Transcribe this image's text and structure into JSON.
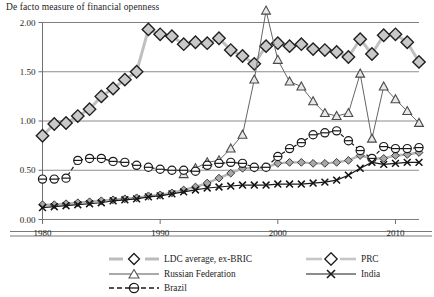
{
  "chart_data": {
    "type": "line",
    "title": "De facto measure of financial openness",
    "xlabel": "",
    "ylabel": "",
    "xlim": [
      1980,
      2012
    ],
    "ylim": [
      0.0,
      2.0
    ],
    "grid": "horizontal",
    "legend_position": "bottom",
    "y_ticks": [
      "0.00",
      "0.50",
      "1.00",
      "1.50",
      "2.00"
    ],
    "y_tick_values": [
      0.0,
      0.5,
      1.0,
      1.5,
      2.0
    ],
    "x_ticks": [
      "1980",
      "1990",
      "2000",
      "2010"
    ],
    "x_tick_values": [
      1980,
      1990,
      2000,
      2010
    ],
    "series": [
      {
        "name": "LDC average, ex-BRIC",
        "marker": "diamond-filled-gray",
        "color": "#8c8c8c",
        "line_color": "#b4b4b4",
        "x": [
          1980,
          1981,
          1982,
          1983,
          1984,
          1985,
          1986,
          1987,
          1988,
          1989,
          1990,
          1991,
          1992,
          1993,
          1994,
          1995,
          1996,
          1997,
          1998,
          1999,
          2000,
          2001,
          2002,
          2003,
          2004,
          2005,
          2006,
          2007,
          2008,
          2009,
          2010,
          2011,
          2012
        ],
        "values": [
          0.15,
          0.15,
          0.16,
          0.17,
          0.18,
          0.19,
          0.2,
          0.21,
          0.22,
          0.24,
          0.25,
          0.27,
          0.3,
          0.33,
          0.37,
          0.42,
          0.47,
          0.52,
          0.52,
          0.53,
          0.57,
          0.58,
          0.58,
          0.57,
          0.57,
          0.58,
          0.6,
          0.65,
          0.62,
          0.62,
          0.65,
          0.66,
          0.68
        ]
      },
      {
        "name": "PRC",
        "marker": "diamond-large-gray",
        "color": "#777777",
        "line_color": "#c0c0c0",
        "x": [
          1980,
          1981,
          1982,
          1983,
          1984,
          1985,
          1986,
          1987,
          1988,
          1989,
          1990,
          1991,
          1992,
          1993,
          1994,
          1995,
          1996,
          1997,
          1998,
          1999,
          2000,
          2001,
          2002,
          2003,
          2004,
          2005,
          2006,
          2007,
          2008,
          2009,
          2010,
          2011,
          2012
        ],
        "values": [
          0.85,
          0.97,
          0.98,
          1.05,
          1.12,
          1.25,
          1.33,
          1.42,
          1.5,
          1.93,
          1.88,
          1.86,
          1.78,
          1.8,
          1.79,
          1.84,
          1.72,
          1.66,
          1.58,
          1.76,
          1.79,
          1.76,
          1.78,
          1.73,
          1.72,
          1.7,
          1.65,
          1.83,
          1.68,
          1.87,
          1.88,
          1.8,
          1.6
        ]
      },
      {
        "name": "Russian Federation",
        "marker": "triangle-open",
        "color": "#666666",
        "line_color": "#666666",
        "x": [
          1992,
          1993,
          1994,
          1995,
          1996,
          1997,
          1998,
          1999,
          2000,
          2001,
          2002,
          2003,
          2004,
          2005,
          2006,
          2007,
          2008,
          2009,
          2010,
          2011,
          2012
        ],
        "values": [
          0.46,
          0.52,
          0.58,
          0.6,
          0.72,
          0.86,
          1.42,
          2.12,
          1.62,
          1.4,
          1.35,
          1.2,
          1.08,
          1.05,
          1.08,
          1.48,
          0.82,
          1.35,
          1.22,
          1.1,
          0.98
        ]
      },
      {
        "name": "India",
        "marker": "x-cross",
        "color": "#1a1a1a",
        "line_color": "#1a1a1a",
        "x": [
          1980,
          1981,
          1982,
          1983,
          1984,
          1985,
          1986,
          1987,
          1988,
          1989,
          1990,
          1991,
          1992,
          1993,
          1994,
          1995,
          1996,
          1997,
          1998,
          1999,
          2000,
          2001,
          2002,
          2003,
          2004,
          2005,
          2006,
          2007,
          2008,
          2009,
          2010,
          2011,
          2012
        ],
        "values": [
          0.12,
          0.13,
          0.14,
          0.15,
          0.16,
          0.17,
          0.19,
          0.2,
          0.21,
          0.23,
          0.24,
          0.26,
          0.28,
          0.3,
          0.32,
          0.33,
          0.34,
          0.35,
          0.35,
          0.35,
          0.36,
          0.36,
          0.36,
          0.37,
          0.38,
          0.4,
          0.45,
          0.52,
          0.58,
          0.56,
          0.57,
          0.58,
          0.58
        ]
      },
      {
        "name": "Brazil",
        "marker": "circle-open-dashed",
        "color": "#1a1a1a",
        "line_color": "#1a1a1a",
        "x": [
          1980,
          1981,
          1982,
          1983,
          1984,
          1985,
          1986,
          1987,
          1988,
          1989,
          1990,
          1991,
          1992,
          1993,
          1994,
          1995,
          1996,
          1997,
          1998,
          1999,
          2000,
          2001,
          2002,
          2003,
          2004,
          2005,
          2006,
          2007,
          2008,
          2009,
          2010,
          2011,
          2012
        ],
        "values": [
          0.41,
          0.41,
          0.42,
          0.6,
          0.62,
          0.62,
          0.59,
          0.58,
          0.55,
          0.53,
          0.51,
          0.5,
          0.5,
          0.49,
          0.55,
          0.57,
          0.58,
          0.57,
          0.53,
          0.53,
          0.64,
          0.72,
          0.78,
          0.86,
          0.88,
          0.9,
          0.8,
          0.7,
          0.62,
          0.74,
          0.72,
          0.72,
          0.73
        ]
      }
    ]
  },
  "legend": {
    "items": [
      {
        "label": "LDC average, ex-BRIC",
        "key": "ldc"
      },
      {
        "label": "Russian Federation",
        "key": "russia"
      },
      {
        "label": "Brazil",
        "key": "brazil"
      },
      {
        "label": "PRC",
        "key": "prc"
      },
      {
        "label": "India",
        "key": "india"
      }
    ]
  }
}
